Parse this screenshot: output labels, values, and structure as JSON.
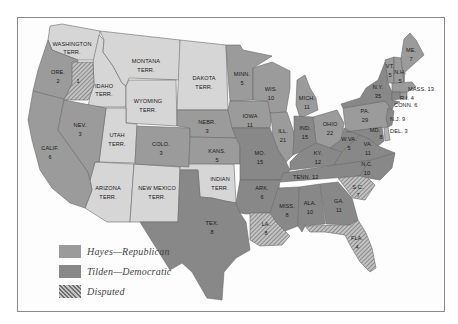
{
  "colors": {
    "hayes": "#9b9b9b",
    "tilden": "#888888",
    "territory": "#d6d6d6",
    "disputed_bg": "#bdbdbd",
    "disputed_stripe": "#6e6e6e",
    "border": "#6a6a6a",
    "frame": "#8a8a8a"
  },
  "legend": {
    "items": [
      {
        "key": "hayes",
        "label": "Hayes—Republican"
      },
      {
        "key": "tilden",
        "label": "Tilden—Democratic"
      },
      {
        "key": "disputed",
        "label": "Disputed"
      }
    ]
  },
  "regions": {
    "washington": {
      "name": "WASHINGTON",
      "sub": "TERR.",
      "status": "territory"
    },
    "oregon": {
      "name": "ORE.",
      "votes": "2",
      "status": "hayes"
    },
    "oregon_disputed": {
      "votes": "1",
      "status": "disputed"
    },
    "idaho": {
      "name": "IDAHO",
      "sub": "TERR.",
      "status": "territory"
    },
    "montana": {
      "name": "MONTANA",
      "sub": "TERR.",
      "status": "territory"
    },
    "wyoming": {
      "name": "WYOMING",
      "sub": "TERR.",
      "status": "territory"
    },
    "dakota": {
      "name": "DAKOTA",
      "sub": "TERR.",
      "status": "territory"
    },
    "california": {
      "name": "CALIF.",
      "votes": "6",
      "status": "hayes"
    },
    "nevada": {
      "name": "NEV.",
      "votes": "3",
      "status": "hayes"
    },
    "utah": {
      "name": "UTAH",
      "sub": "TERR.",
      "status": "territory"
    },
    "colorado": {
      "name": "COLO.",
      "votes": "3",
      "status": "hayes"
    },
    "arizona": {
      "name": "ARIZONA",
      "sub": "TERR.",
      "status": "territory"
    },
    "new_mexico": {
      "name": "NEW MEXICO",
      "sub": "TERR.",
      "status": "territory"
    },
    "nebraska": {
      "name": "NEBR.",
      "votes": "3",
      "status": "hayes"
    },
    "kansas": {
      "name": "KANS.",
      "votes": "5",
      "status": "hayes"
    },
    "indian": {
      "name": "INDIAN",
      "sub": "TERR.",
      "status": "territory"
    },
    "texas": {
      "name": "TEX.",
      "votes": "8",
      "status": "tilden"
    },
    "minnesota": {
      "name": "MINN.",
      "votes": "5",
      "status": "hayes"
    },
    "iowa": {
      "name": "IOWA",
      "votes": "11",
      "status": "hayes"
    },
    "missouri": {
      "name": "MO.",
      "votes": "15",
      "status": "tilden"
    },
    "arkansas": {
      "name": "ARK.",
      "votes": "6",
      "status": "tilden"
    },
    "louisiana": {
      "name": "LA.",
      "votes": "8",
      "status": "disputed"
    },
    "wisconsin": {
      "name": "WIS.",
      "votes": "10",
      "status": "hayes"
    },
    "illinois": {
      "name": "ILL.",
      "votes": "21",
      "status": "hayes"
    },
    "michigan": {
      "name": "MICH.",
      "votes": "11",
      "status": "hayes"
    },
    "indiana": {
      "name": "IND.",
      "votes": "15",
      "status": "tilden"
    },
    "ohio": {
      "name": "OHIO",
      "votes": "22",
      "status": "hayes"
    },
    "kentucky": {
      "name": "KY.",
      "votes": "12",
      "status": "tilden"
    },
    "tennessee": {
      "name": "TENN.",
      "votes": "12",
      "status": "tilden"
    },
    "mississippi": {
      "name": "MISS.",
      "votes": "8",
      "status": "tilden"
    },
    "alabama": {
      "name": "ALA.",
      "votes": "10",
      "status": "tilden"
    },
    "georgia": {
      "name": "GA.",
      "votes": "11",
      "status": "tilden"
    },
    "florida": {
      "name": "FLA.",
      "votes": "4",
      "status": "disputed"
    },
    "south_carolina": {
      "name": "S.C.",
      "votes": "7",
      "status": "disputed"
    },
    "north_carolina": {
      "name": "N.C.",
      "votes": "10",
      "status": "tilden"
    },
    "virginia": {
      "name": "VA.",
      "votes": "11",
      "status": "tilden"
    },
    "west_virginia": {
      "name": "W.VA.",
      "votes": "5",
      "status": "tilden"
    },
    "maryland": {
      "name": "MD.",
      "votes": "8",
      "status": "tilden"
    },
    "delaware": {
      "name": "DEL.",
      "votes": "3",
      "status": "tilden"
    },
    "pennsylvania": {
      "name": "PA.",
      "votes": "29",
      "status": "hayes"
    },
    "new_jersey": {
      "name": "N.J.",
      "votes": "9",
      "status": "tilden"
    },
    "new_york": {
      "name": "N.Y.",
      "votes": "35",
      "status": "tilden"
    },
    "connecticut": {
      "name": "CONN.",
      "votes": "6",
      "status": "tilden"
    },
    "rhode_island": {
      "name": "R.I.",
      "votes": "4",
      "status": "hayes"
    },
    "massachusetts": {
      "name": "MASS.",
      "votes": "13",
      "status": "hayes"
    },
    "vermont": {
      "name": "VT.",
      "votes": "5",
      "status": "hayes"
    },
    "new_hampshire": {
      "name": "N.H.",
      "votes": "5",
      "status": "hayes"
    },
    "maine": {
      "name": "ME.",
      "votes": "7",
      "status": "hayes"
    }
  },
  "inline_labels": {
    "mass": "MASS. 13",
    "ri": "R.I. 4",
    "conn": "CONN. 6",
    "nj": "N.J. 9",
    "del": "DEL. 3",
    "tenn": "TENN. 12"
  }
}
